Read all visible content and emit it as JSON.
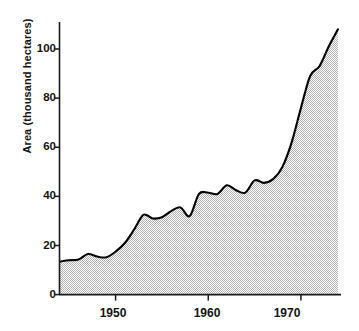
{
  "chart_data": {
    "type": "area",
    "title": "",
    "xlabel": "",
    "ylabel": "Area (thousand hectares)",
    "xlim": [
      1944,
      1974
    ],
    "ylim": [
      0,
      112
    ],
    "grid": false,
    "legend": null,
    "xticks": [
      1950,
      1960,
      1970
    ],
    "xtick_labels": [
      "1950",
      "1960",
      "1970"
    ],
    "yticks": [
      0,
      20,
      40,
      60,
      80,
      100
    ],
    "ytick_labels": [
      "0",
      "20",
      "40",
      "60",
      "80",
      "100"
    ],
    "fill_pattern": "halftone-checker-gray",
    "fill_color": "#b9b9b9",
    "line_color": "#000000",
    "axis_color": "#1a1a1a",
    "x": [
      1944,
      1945,
      1946,
      1947,
      1948,
      1949,
      1950,
      1951,
      1952,
      1953,
      1954,
      1955,
      1956,
      1957,
      1958,
      1959,
      1960,
      1961,
      1962,
      1963,
      1964,
      1965,
      1966,
      1967,
      1968,
      1969,
      1970,
      1971,
      1972,
      1973,
      1974
    ],
    "values": [
      13.5,
      14.0,
      14.3,
      16.5,
      15.5,
      15.2,
      17.5,
      21.0,
      26.5,
      32.5,
      31.0,
      31.5,
      34.0,
      35.5,
      32.0,
      41.0,
      41.5,
      41.0,
      44.5,
      42.5,
      41.5,
      46.5,
      45.5,
      47.0,
      52.0,
      62.0,
      76.0,
      89.0,
      93.0,
      101.0,
      108.0
    ],
    "series": [
      {
        "name": "Area",
        "values": [
          13.5,
          14.0,
          14.3,
          16.5,
          15.5,
          15.2,
          17.5,
          21.0,
          26.5,
          32.5,
          31.0,
          31.5,
          34.0,
          35.5,
          32.0,
          41.0,
          41.5,
          41.0,
          44.5,
          42.5,
          41.5,
          46.5,
          45.5,
          47.0,
          52.0,
          62.0,
          76.0,
          89.0,
          93.0,
          101.0,
          108.0
        ]
      }
    ]
  }
}
